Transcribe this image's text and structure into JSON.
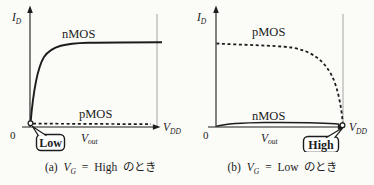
{
  "figure": {
    "ink_color": "#1c1c1c",
    "guide_color": "#9b9b9b",
    "background": "#fbfbf8",
    "panels": [
      {
        "id": "a",
        "y_axis": {
          "main": "I",
          "sub": "D"
        },
        "x_axis": {
          "main": "V",
          "sub": "out"
        },
        "x_end": {
          "main": "V",
          "sub": "DD"
        },
        "origin": "0",
        "curves": [
          {
            "name": "nMOS",
            "style": "solid",
            "level": "high"
          },
          {
            "name": "pMOS",
            "style": "dashed",
            "level": "low"
          }
        ],
        "callout": {
          "label": "Low",
          "points_to": "origin"
        },
        "caption": {
          "prefix": "(a)",
          "var": "V",
          "var_sub": "G",
          "eq": "=",
          "value": "High",
          "suffix": "のとき"
        }
      },
      {
        "id": "b",
        "y_axis": {
          "main": "I",
          "sub": "D"
        },
        "x_axis": {
          "main": "V",
          "sub": "out"
        },
        "x_end": {
          "main": "V",
          "sub": "DD"
        },
        "origin": "0",
        "curves": [
          {
            "name": "pMOS",
            "style": "dashed",
            "level": "high"
          },
          {
            "name": "nMOS",
            "style": "solid",
            "level": "low"
          }
        ],
        "callout": {
          "label": "High",
          "points_to": "vdd"
        },
        "caption": {
          "prefix": "(b)",
          "var": "V",
          "var_sub": "G",
          "eq": "=",
          "value": "Low",
          "suffix": "のとき"
        }
      }
    ]
  }
}
